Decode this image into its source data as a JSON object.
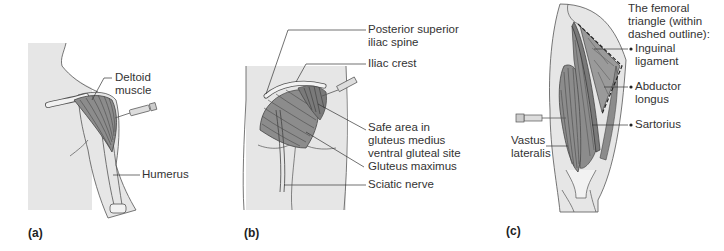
{
  "figure": {
    "panels": [
      {
        "id": "a",
        "tag": "(a)",
        "site": "deltoid",
        "labels": {
          "deltoid": "Deltoid muscle",
          "deltoid_l1": "Deltoid",
          "deltoid_l2": "muscle",
          "humerus": "Humerus"
        }
      },
      {
        "id": "b",
        "tag": "(b)",
        "site": "ventrogluteal",
        "labels": {
          "psis_l1": "Posterior superior",
          "psis_l2": "iliac spine",
          "iliac_crest": "Iliac crest",
          "safe_l1": "Safe area in",
          "safe_l2": "gluteus medius",
          "safe_l3": "ventral gluteal site",
          "gluteus_maximus": "Gluteus maximus",
          "sciatic_nerve": "Sciatic nerve"
        }
      },
      {
        "id": "c",
        "tag": "(c)",
        "site": "vastus lateralis",
        "labels": {
          "fem_l1": "The femoral",
          "fem_l2": "triangle (within",
          "fem_l3": "dashed outline):",
          "inguinal_l1": "Inguinal",
          "inguinal_l2": "ligament",
          "abductor_l1": "Abductor",
          "abductor_l2": "longus",
          "sartorius": "Sartorius",
          "vastus_l1": "Vastus",
          "vastus_l2": "lateralis"
        }
      }
    ],
    "colors": {
      "skin": "#e6e6e6",
      "muscle": "#8c8c8c",
      "muscle_line": "#4a4a4a",
      "outline": "#555555",
      "text": "#333333",
      "background": "#ffffff"
    }
  }
}
